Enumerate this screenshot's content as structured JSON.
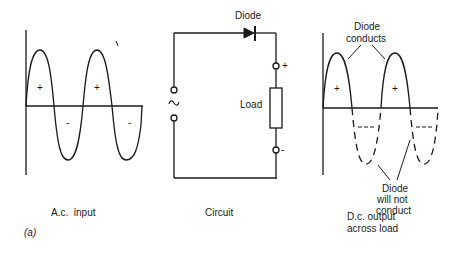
{
  "figure": {
    "label": "(a)",
    "colors": {
      "ink": "#1a1a1a",
      "background": "#ffffff"
    }
  },
  "panels": {
    "ac_input": {
      "caption": "A.c.  input",
      "plus_sign": "+",
      "minus_sign": "-"
    },
    "circuit": {
      "caption": "Circuit",
      "diode_label": "Diode",
      "load_label": "Load",
      "source_symbol": "~",
      "plus_terminal": "+",
      "minus_terminal": "-"
    },
    "dc_output": {
      "caption_line1": "D.c. output",
      "caption_line2": "across load",
      "conducts_line1": "Diode",
      "conducts_line2": "conducts",
      "not_conduct_line1": "Diode",
      "not_conduct_line2": "will not",
      "not_conduct_line3": "conduct",
      "plus_sign": "+",
      "dash_marker": "---"
    }
  }
}
